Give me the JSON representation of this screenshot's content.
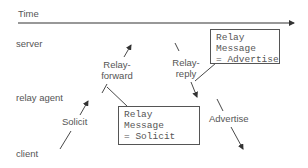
{
  "timeline": {
    "label": "Time"
  },
  "lanes": {
    "server": "server",
    "relay_agent": "relay agent",
    "client": "client"
  },
  "messages": {
    "solicit": "Solicit",
    "relay_forward_line1": "Relay-",
    "relay_forward_line2": "forward",
    "relay_reply_line1": "Relay-",
    "relay_reply_line2": "reply",
    "advertise": "Advertise"
  },
  "callouts": {
    "relay_solicit": {
      "line1": "Relay",
      "line2": "Message",
      "line3": "= Solicit"
    },
    "relay_advertise": {
      "line1": "Relay",
      "line2": "Message",
      "line3": "= Advertise"
    }
  },
  "colors": {
    "line": "#333333",
    "text": "#555555",
    "background": "#ffffff"
  }
}
